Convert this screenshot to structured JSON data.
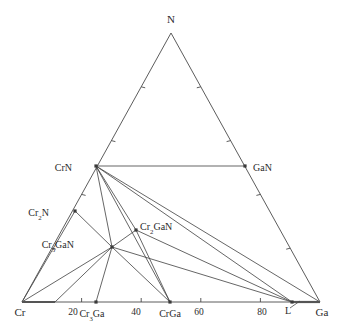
{
  "figure": {
    "type": "ternary-phase-diagram",
    "system": "Cr-Ga-N",
    "background_color": "#ffffff",
    "line_color": "#4a4a4a",
    "text_color": "#2b2b2b"
  },
  "vertices": {
    "top": {
      "label": "N",
      "x": 171,
      "y": 33
    },
    "bottom_left": {
      "label": "Cr",
      "x": 22,
      "y": 302
    },
    "bottom_right": {
      "label": "Ga",
      "x": 320,
      "y": 302
    }
  },
  "axis": {
    "bottom_tick_labels": [
      "20",
      "40",
      "60",
      "80"
    ],
    "bottom_tick_values": [
      20,
      40,
      60,
      80
    ]
  },
  "points": [
    {
      "name": "CrN",
      "label_main": "CrN",
      "label_sub": "",
      "label_tail": "",
      "x": 96,
      "y": 166,
      "lx": 72,
      "ly": 169,
      "anchor": "end"
    },
    {
      "name": "GaN",
      "label_main": "GaN",
      "label_sub": "",
      "label_tail": "",
      "x": 245,
      "y": 166,
      "lx": 253,
      "ly": 169,
      "anchor": "start"
    },
    {
      "name": "Cr2N",
      "label_main": "Cr",
      "label_sub": "2",
      "label_tail": "N",
      "x": 75,
      "y": 211,
      "lx": 49,
      "ly": 214,
      "anchor": "end"
    },
    {
      "name": "Cr3GaN",
      "label_main": "Cr",
      "label_sub": "3",
      "label_tail": "GaN",
      "x": 112,
      "y": 247,
      "lx": 74,
      "ly": 246,
      "anchor": "end"
    },
    {
      "name": "Cr2GaN",
      "label_main": "Cr",
      "label_sub": "2",
      "label_tail": "GaN",
      "x": 136,
      "y": 230,
      "lx": 140,
      "ly": 228,
      "anchor": "start"
    },
    {
      "name": "Cr3Ga",
      "label_main": "Cr",
      "label_sub": "3",
      "label_tail": "Ga",
      "x": 96,
      "y": 302,
      "lx": 92,
      "ly": 315,
      "anchor": "middle"
    },
    {
      "name": "CrGa",
      "label_main": "CrGa",
      "label_sub": "",
      "label_tail": "",
      "x": 170,
      "y": 302,
      "lx": 170,
      "ly": 315,
      "anchor": "middle"
    },
    {
      "name": "L",
      "label_main": "L",
      "label_sub": "",
      "label_tail": "",
      "x": 292,
      "y": 302,
      "lx": 288,
      "ly": 312,
      "anchor": "middle"
    }
  ],
  "tick_labels_bottom": [
    {
      "text": "20",
      "x": 73,
      "y": 315
    },
    {
      "text": "40",
      "x": 136,
      "y": 315
    },
    {
      "text": "60",
      "x": 199,
      "y": 315
    },
    {
      "text": "80",
      "x": 262,
      "y": 315
    }
  ],
  "vertex_labels": [
    {
      "text": "Cr",
      "x": 20,
      "y": 316,
      "anchor": "middle"
    },
    {
      "text": "Ga",
      "x": 322,
      "y": 316,
      "anchor": "middle"
    },
    {
      "text": "N",
      "x": 171,
      "y": 23,
      "anchor": "middle"
    }
  ],
  "tie_lines": [
    {
      "from": "CrN",
      "to": "GaN",
      "x1": 96,
      "y1": 166,
      "x2": 245,
      "y2": 166
    },
    {
      "from": "CrN",
      "to": "Cr2GaN",
      "x1": 96,
      "y1": 166,
      "x2": 136,
      "y2": 230
    },
    {
      "from": "CrN",
      "to": "Cr3GaN",
      "x1": 96,
      "y1": 166,
      "x2": 112,
      "y2": 247
    },
    {
      "from": "CrN",
      "to": "L",
      "x1": 96,
      "y1": 166,
      "x2": 292,
      "y2": 302
    },
    {
      "from": "CrN",
      "to": "Ga",
      "x1": 96,
      "y1": 166,
      "x2": 320,
      "y2": 302
    },
    {
      "from": "CrN",
      "to": "CrGa",
      "x1": 96,
      "y1": 166,
      "x2": 170,
      "y2": 302
    },
    {
      "from": "Cr2N",
      "to": "Cr3GaN",
      "x1": 75,
      "y1": 211,
      "x2": 112,
      "y2": 247
    },
    {
      "from": "Cr3GaN",
      "to": "Cr2GaN",
      "x1": 112,
      "y1": 247,
      "x2": 136,
      "y2": 230
    },
    {
      "from": "Cr2GaN",
      "to": "CrGa",
      "x1": 136,
      "y1": 230,
      "x2": 170,
      "y2": 302
    },
    {
      "from": "Cr2GaN",
      "to": "L",
      "x1": 136,
      "y1": 230,
      "x2": 292,
      "y2": 302
    },
    {
      "from": "Cr3GaN",
      "to": "L",
      "x1": 112,
      "y1": 247,
      "x2": 292,
      "y2": 302
    },
    {
      "from": "Cr3GaN",
      "to": "CrGa",
      "x1": 112,
      "y1": 247,
      "x2": 170,
      "y2": 302
    },
    {
      "from": "Cr3GaN",
      "to": "Cr3Ga",
      "x1": 112,
      "y1": 247,
      "x2": 96,
      "y2": 302
    },
    {
      "from": "Cr3GaN",
      "to": "Cr",
      "x1": 112,
      "y1": 247,
      "x2": 22,
      "y2": 302
    },
    {
      "from": "Cr3GaN",
      "to": "Cr-tie",
      "x1": 112,
      "y1": 247,
      "x2": 55,
      "y2": 302
    },
    {
      "from": "Cr2N",
      "to": "Cr",
      "x1": 75,
      "y1": 211,
      "x2": 22,
      "y2": 302
    }
  ],
  "edge_ticks": {
    "left_edge_count": 4,
    "right_edge_count": 4,
    "bottom_edge_count": 4
  },
  "leader_lines": [
    {
      "name": "L-leader",
      "x1": 290,
      "y1": 308,
      "x2": 300,
      "y2": 301
    }
  ],
  "highlight_segments": [
    {
      "name": "Cr-rich-bottom",
      "x1": 22,
      "y1": 302,
      "x2": 55,
      "y2": 302
    },
    {
      "name": "L-Ga-bottom",
      "x1": 292,
      "y1": 302,
      "x2": 320,
      "y2": 302
    }
  ]
}
